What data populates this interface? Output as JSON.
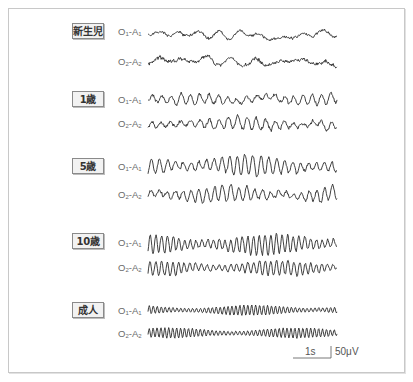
{
  "figure": {
    "title": "",
    "frame": {
      "border_color": "#c8c8c8"
    },
    "trace_color": "#2a2a2a",
    "label_box": {
      "background": "#f2f2f2",
      "border": "#8a8a8a"
    }
  },
  "groups": [
    {
      "age": "新生児",
      "leads": [
        {
          "main": "O",
          "sub1": "1",
          "sep": "-A",
          "sub2": "1"
        },
        {
          "main": "O",
          "sub1": "2",
          "sep": "-A",
          "sub2": "2"
        }
      ]
    },
    {
      "age": "1歳",
      "leads": [
        {
          "main": "O",
          "sub1": "1",
          "sep": "-A",
          "sub2": "1"
        },
        {
          "main": "O",
          "sub1": "2",
          "sep": "-A",
          "sub2": "2"
        }
      ]
    },
    {
      "age": "5歳",
      "leads": [
        {
          "main": "O",
          "sub1": "1",
          "sep": "-A",
          "sub2": "1"
        },
        {
          "main": "O",
          "sub1": "2",
          "sep": "-A",
          "sub2": "2"
        }
      ]
    },
    {
      "age": "10歳",
      "leads": [
        {
          "main": "O",
          "sub1": "1",
          "sep": "-A",
          "sub2": "1"
        },
        {
          "main": "O",
          "sub1": "2",
          "sep": "-A",
          "sub2": "2"
        }
      ]
    },
    {
      "age": "成人",
      "leads": [
        {
          "main": "O",
          "sub1": "1",
          "sep": "-A",
          "sub2": "1"
        },
        {
          "main": "O",
          "sub1": "2",
          "sep": "-A",
          "sub2": "2"
        }
      ]
    }
  ],
  "scale_bar": {
    "time_label": "1s",
    "amplitude_label": "50μV"
  },
  "chart_data": {
    "type": "line",
    "title": "",
    "data_note": "Points arrays are SYNTHETIC approximations, not digitized from the image. They are procedurally generated (seeded pseudo-random noise plus sinusoids) to mimic each age group's qualitative character. The amplitude_px, freq_cycles and irregularity values are eyeballed estimates; none of these numbers were measured from the source traces.",
    "x_range_px": [
      148,
      337
    ],
    "scale": {
      "time": "1s",
      "amplitude": "50μV",
      "time_bar_px": 38
    },
    "series": [
      {
        "name": "新生児 O1-A1",
        "baseline_y": 34,
        "amplitude_px": 5,
        "freq_cycles": 9,
        "irregularity": 0.9,
        "seed": 11
      },
      {
        "name": "新生児 O2-A2",
        "baseline_y": 62,
        "amplitude_px": 6,
        "freq_cycles": 8,
        "irregularity": 0.9,
        "seed": 23
      },
      {
        "name": "1歳 O1-A1",
        "baseline_y": 99,
        "amplitude_px": 7,
        "freq_cycles": 20,
        "irregularity": 0.7,
        "seed": 37
      },
      {
        "name": "1歳 O2-A2",
        "baseline_y": 124,
        "amplitude_px": 8,
        "freq_cycles": 20,
        "irregularity": 0.7,
        "seed": 41
      },
      {
        "name": "5歳 O1-A1",
        "baseline_y": 167,
        "amplitude_px": 11,
        "freq_cycles": 24,
        "irregularity": 0.45,
        "seed": 53
      },
      {
        "name": "5歳 O2-A2",
        "baseline_y": 195,
        "amplitude_px": 9,
        "freq_cycles": 24,
        "irregularity": 0.5,
        "seed": 67
      },
      {
        "name": "10歳 O1-A1",
        "baseline_y": 244,
        "amplitude_px": 11,
        "freq_cycles": 33,
        "irregularity": 0.4,
        "seed": 71
      },
      {
        "name": "10歳 O2-A2",
        "baseline_y": 268,
        "amplitude_px": 8,
        "freq_cycles": 33,
        "irregularity": 0.4,
        "seed": 83
      },
      {
        "name": "成人 O1-A1",
        "baseline_y": 310,
        "amplitude_px": 5,
        "freq_cycles": 48,
        "irregularity": 0.15,
        "seed": 97
      },
      {
        "name": "成人 O2-A2",
        "baseline_y": 333,
        "amplitude_px": 5,
        "freq_cycles": 48,
        "irregularity": 0.15,
        "seed": 101
      }
    ]
  }
}
